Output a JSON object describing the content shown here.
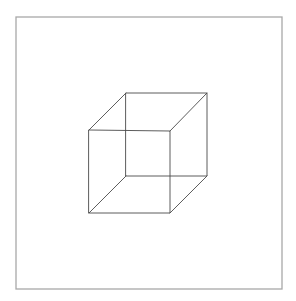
{
  "figure": {
    "kind": "necker-cube",
    "background": "#ffffff",
    "frame": {
      "x": 16,
      "y": 17,
      "width": 266,
      "height": 272,
      "stroke": "#a8a8a8",
      "stroke_width": 1.3
    },
    "cube": {
      "stroke": "#4a4a4a",
      "stroke_width": 0.9,
      "front_face": {
        "top_left": [
          89,
          130
        ],
        "top_right": [
          170,
          131
        ],
        "bottom_right": [
          170,
          213
        ],
        "bottom_left": [
          89,
          213
        ]
      },
      "back_face": {
        "top_left": [
          126,
          93
        ],
        "top_right": [
          207,
          93
        ],
        "bottom_right": [
          207,
          176
        ],
        "bottom_left": [
          126,
          176
        ]
      }
    }
  }
}
